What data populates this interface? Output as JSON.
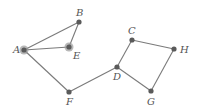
{
  "diagram": {
    "type": "undirected-graph",
    "colors": {
      "edge": "#7a7a7a",
      "node": "#5a5a5a",
      "label": "#555555",
      "halo": "#9a9a9a"
    },
    "nodes": [
      {
        "id": "A",
        "label": "A",
        "x": 24,
        "y": 50,
        "halo": true,
        "lx": 13,
        "ly": 53
      },
      {
        "id": "B",
        "label": "B",
        "x": 79,
        "y": 22,
        "halo": false,
        "lx": 76,
        "ly": 16
      },
      {
        "id": "E",
        "label": "E",
        "x": 69,
        "y": 47,
        "halo": true,
        "lx": 73,
        "ly": 59
      },
      {
        "id": "F",
        "label": "F",
        "x": 69,
        "y": 92,
        "halo": false,
        "lx": 66,
        "ly": 105
      },
      {
        "id": "D",
        "label": "D",
        "x": 117,
        "y": 67,
        "halo": false,
        "lx": 113,
        "ly": 80
      },
      {
        "id": "C",
        "label": "C",
        "x": 132,
        "y": 40,
        "halo": false,
        "lx": 128,
        "ly": 34
      },
      {
        "id": "H",
        "label": "H",
        "x": 174,
        "y": 49,
        "halo": false,
        "lx": 180,
        "ly": 53
      },
      {
        "id": "G",
        "label": "G",
        "x": 151,
        "y": 91,
        "halo": false,
        "lx": 147,
        "ly": 105
      }
    ],
    "edges": [
      [
        "A",
        "B"
      ],
      [
        "A",
        "E"
      ],
      [
        "B",
        "E"
      ],
      [
        "A",
        "F"
      ],
      [
        "F",
        "D"
      ],
      [
        "D",
        "C"
      ],
      [
        "C",
        "H"
      ],
      [
        "H",
        "G"
      ],
      [
        "G",
        "D"
      ]
    ]
  }
}
